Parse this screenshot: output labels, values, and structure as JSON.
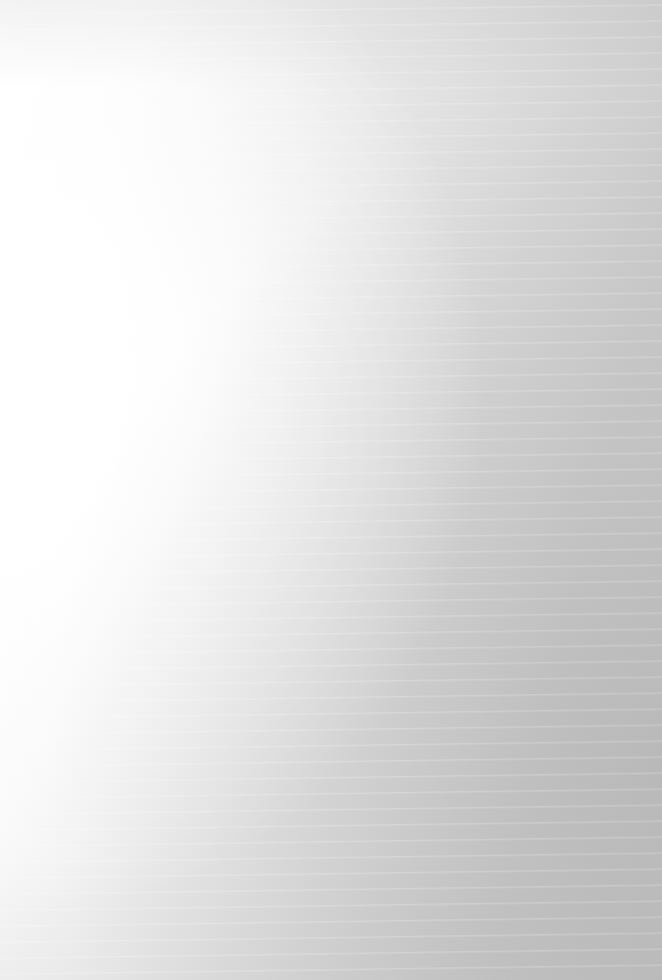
{
  "document": {
    "kind": "scanned-page",
    "legibility": "illegible",
    "condition_note": "Overexposed / faded scan: text is present but not readable at any zoom level.",
    "page_width": 662,
    "page_height": 980,
    "background_color": "#fdfdfd",
    "ink_color": "#8e8e8e",
    "wash_light_color": "#ffffff",
    "wash_dark_color": "#c6c6c6",
    "text_left": 125,
    "text_right": 556,
    "line_height": 20,
    "heading": {
      "text": "",
      "readable": false,
      "x": 60,
      "y": 48,
      "width": 150
    },
    "separator": {
      "present": true,
      "y": 545,
      "x": 90,
      "width": 545
    },
    "blocks": [
      {
        "name": "heading-line",
        "type": "heading",
        "x": 60,
        "y": 48,
        "lines": [
          150
        ]
      },
      {
        "name": "paragraph-1",
        "type": "paragraph",
        "x": 125,
        "y": 122,
        "lines": [
          430,
          418
        ]
      },
      {
        "name": "paragraph-2",
        "type": "paragraph",
        "x": 125,
        "y": 180,
        "lines": [
          428,
          430,
          415
        ]
      },
      {
        "name": "paragraph-3",
        "type": "paragraph",
        "x": 125,
        "y": 258,
        "lines": [
          430,
          426,
          352
        ]
      },
      {
        "name": "paragraph-4",
        "type": "paragraph",
        "x": 125,
        "y": 336,
        "lines": [
          430,
          424
        ]
      },
      {
        "name": "indented-line",
        "type": "paragraph",
        "x": 150,
        "y": 396,
        "lines": [
          330
        ]
      },
      {
        "name": "paragraph-5",
        "type": "paragraph",
        "x": 125,
        "y": 436,
        "lines": [
          430,
          429,
          298
        ]
      },
      {
        "name": "paragraph-6",
        "type": "paragraph",
        "x": 125,
        "y": 496,
        "lines": [
          430,
          409
        ]
      },
      {
        "name": "paragraph-7",
        "type": "paragraph",
        "x": 125,
        "y": 574,
        "lines": [
          430,
          428,
          430,
          346
        ]
      },
      {
        "name": "paragraph-8",
        "type": "paragraph",
        "x": 125,
        "y": 672,
        "lines": [
          430,
          425,
          430,
          260
        ]
      },
      {
        "name": "paragraph-9",
        "type": "paragraph",
        "x": 125,
        "y": 772,
        "lines": [
          428,
          430,
          204
        ]
      }
    ]
  }
}
